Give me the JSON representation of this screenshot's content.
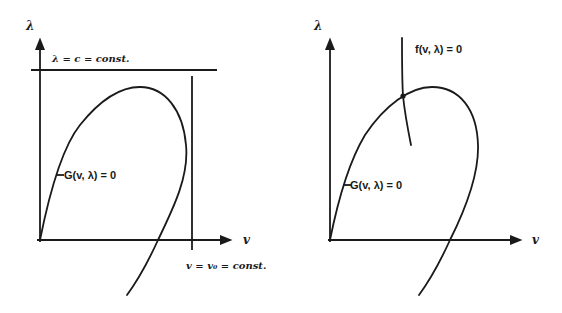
{
  "left_panel": {
    "y_axis_label": "λ",
    "x_axis_label": "v",
    "horizontal_constraint_label": "λ = c = const.",
    "vertical_constraint_label": "v = v₀ = const.",
    "curve_label": "G(v, λ) = 0"
  },
  "right_panel": {
    "y_axis_label": "λ",
    "x_axis_label": "v",
    "constraint_curve_label": "f(v, λ) = 0",
    "curve_label": "G(v, λ) = 0"
  },
  "colors": {
    "ink": "#1a1a1a",
    "background": "#ffffff"
  }
}
